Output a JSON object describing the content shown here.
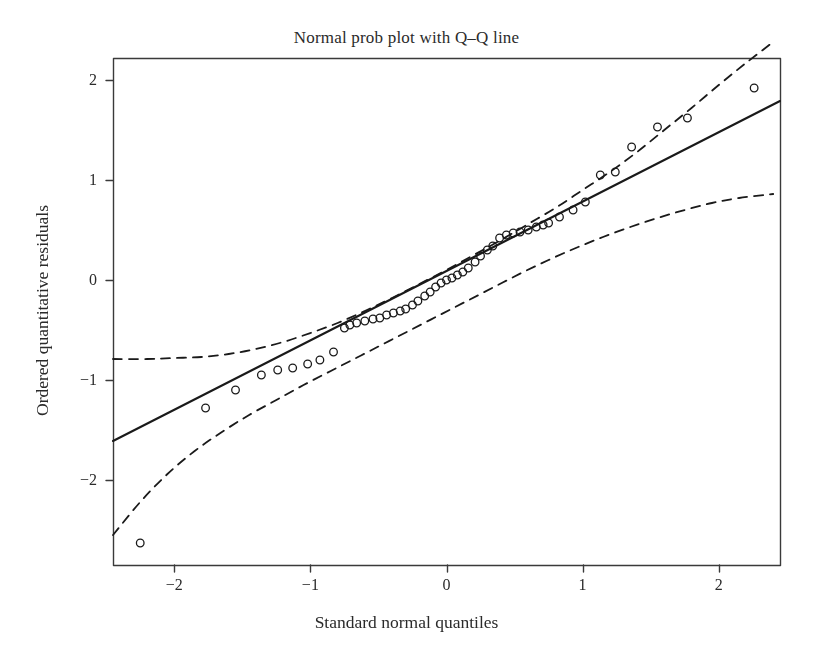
{
  "chart_data": {
    "type": "scatter",
    "title": "Normal prob plot with Q–Q line",
    "xlabel": "Standard normal quantiles",
    "ylabel": "Ordered quantitative residuals",
    "grid": false,
    "legend": "none",
    "xlim": [
      -2.45,
      2.45
    ],
    "ylim": [
      -2.85,
      2.22
    ],
    "xticks": [
      -2,
      -1,
      0,
      1,
      2
    ],
    "xtick_labels": [
      "−2",
      "−1",
      "0",
      "1",
      "2"
    ],
    "yticks": [
      -2,
      -1,
      0,
      1,
      2
    ],
    "ytick_labels": [
      "−2",
      "−1",
      "0",
      "1",
      "2"
    ],
    "marker": "open-circle",
    "marker_color": "#1a1a1a",
    "marker_size": 5,
    "points": {
      "x": [
        -2.25,
        -1.77,
        -1.55,
        -1.36,
        -1.24,
        -1.13,
        -1.02,
        -0.93,
        -0.83,
        -0.75,
        -0.71,
        -0.66,
        -0.6,
        -0.54,
        -0.49,
        -0.44,
        -0.39,
        -0.34,
        -0.3,
        -0.25,
        -0.21,
        -0.16,
        -0.12,
        -0.08,
        -0.04,
        0.0,
        0.04,
        0.08,
        0.12,
        0.16,
        0.21,
        0.25,
        0.3,
        0.34,
        0.39,
        0.44,
        0.49,
        0.54,
        0.6,
        0.66,
        0.71,
        0.75,
        0.83,
        0.93,
        1.02,
        1.13,
        1.24,
        1.36,
        1.55,
        1.77,
        2.26
      ],
      "y": [
        -2.63,
        -1.28,
        -1.1,
        -0.95,
        -0.9,
        -0.88,
        -0.84,
        -0.8,
        -0.72,
        -0.48,
        -0.45,
        -0.43,
        -0.41,
        -0.39,
        -0.38,
        -0.35,
        -0.33,
        -0.31,
        -0.29,
        -0.25,
        -0.21,
        -0.16,
        -0.12,
        -0.07,
        -0.03,
        0.0,
        0.02,
        0.05,
        0.08,
        0.12,
        0.18,
        0.24,
        0.3,
        0.34,
        0.42,
        0.45,
        0.47,
        0.48,
        0.5,
        0.53,
        0.55,
        0.57,
        0.63,
        0.7,
        0.78,
        1.05,
        1.08,
        1.33,
        1.53,
        1.62,
        1.92
      ]
    },
    "qq_line": {
      "name": "Q–Q line",
      "style": "solid",
      "color": "#1a1a1a",
      "width": 2.1,
      "x": [
        -2.45,
        2.45
      ],
      "y": [
        -1.61,
        1.79
      ]
    },
    "confidence_bands": {
      "name": "Confidence envelope",
      "style": "dashed",
      "color": "#1a1a1a",
      "width": 1.8,
      "upper": {
        "x": [
          -2.45,
          -2.2,
          -2.0,
          -1.8,
          -1.6,
          -1.4,
          -1.2,
          -1.0,
          -0.8,
          -0.6,
          -0.4,
          -0.2,
          0.0,
          0.2,
          0.4,
          0.6,
          0.8,
          1.0,
          1.2,
          1.4,
          1.6,
          1.8,
          2.0,
          2.2,
          2.4
        ],
        "y": [
          -0.79,
          -0.79,
          -0.78,
          -0.77,
          -0.74,
          -0.69,
          -0.62,
          -0.53,
          -0.43,
          -0.31,
          -0.18,
          -0.04,
          0.1,
          0.25,
          0.4,
          0.56,
          0.72,
          0.9,
          1.08,
          1.28,
          1.5,
          1.72,
          1.95,
          2.17,
          2.38
        ]
      },
      "lower": {
        "x": [
          -2.45,
          -2.25,
          -2.05,
          -1.85,
          -1.65,
          -1.45,
          -1.25,
          -1.05,
          -0.85,
          -0.65,
          -0.45,
          -0.25,
          -0.05,
          0.15,
          0.35,
          0.55,
          0.75,
          0.95,
          1.15,
          1.35,
          1.55,
          1.75,
          1.95,
          2.15,
          2.4
        ],
        "y": [
          -2.55,
          -2.22,
          -1.94,
          -1.71,
          -1.52,
          -1.35,
          -1.2,
          -1.05,
          -0.91,
          -0.77,
          -0.63,
          -0.49,
          -0.35,
          -0.21,
          -0.07,
          0.07,
          0.2,
          0.32,
          0.43,
          0.53,
          0.62,
          0.7,
          0.77,
          0.82,
          0.86
        ]
      }
    },
    "axes": {
      "frame_color": "#3a3a3a",
      "frame_width": 1.4,
      "plot_left_px": 113,
      "plot_right_px": 780,
      "plot_top_px": 58,
      "plot_bottom_px": 565
    }
  }
}
